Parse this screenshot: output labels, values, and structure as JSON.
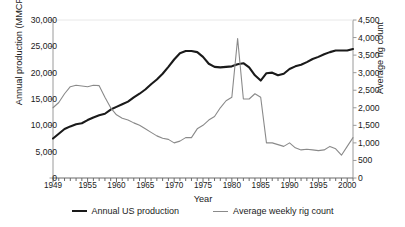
{
  "figure": {
    "cut_off_title": "",
    "background": "#ffffff"
  },
  "axes": {
    "x": {
      "label": "Year",
      "min": 1949,
      "max": 2001,
      "tick_labels": [
        "1949",
        "1955",
        "1960",
        "1965",
        "1970",
        "1975",
        "1980",
        "1985",
        "1990",
        "1995",
        "2000"
      ],
      "tick_values": [
        1949,
        1955,
        1960,
        1965,
        1970,
        1975,
        1980,
        1985,
        1990,
        1995,
        2000
      ],
      "minor_tick_interval": 1
    },
    "y_left": {
      "label": "Annual production (MMCF)",
      "min": 0,
      "max": 30000,
      "tick_labels": [
        "0",
        "5,000",
        "10,000",
        "15,000",
        "20,000",
        "25,000",
        "30,000"
      ],
      "tick_values": [
        0,
        5000,
        10000,
        15000,
        20000,
        25000,
        30000
      ]
    },
    "y_right": {
      "label": "Average rig count",
      "min": 0,
      "max": 4500,
      "tick_labels": [
        "0",
        "500",
        "1,000",
        "1,500",
        "2,000",
        "2,500",
        "3,000",
        "3,500",
        "4,000",
        "4,500"
      ],
      "tick_values": [
        0,
        500,
        1000,
        1500,
        2000,
        2500,
        3000,
        3500,
        4000,
        4500
      ]
    }
  },
  "legend": {
    "position": "bottom-center",
    "entries": [
      {
        "label": "Annual US production",
        "color": "#1a1a1a",
        "width": 2.1,
        "axis": "y_left"
      },
      {
        "label": "Average weekly rig count",
        "color": "#8a8a8a",
        "width": 1.1,
        "axis": "y_right"
      }
    ]
  },
  "chart_data": {
    "type": "line",
    "title": "",
    "xlabel": "Year",
    "ylabel": "Annual production (MMCF)",
    "y2label": "Average rig count",
    "xlim": [
      1949,
      2001
    ],
    "ylim": [
      0,
      30000
    ],
    "y2lim": [
      0,
      4500
    ],
    "grid": false,
    "legend_position": "bottom-center",
    "x": [
      1949,
      1950,
      1951,
      1952,
      1953,
      1954,
      1955,
      1956,
      1957,
      1958,
      1959,
      1960,
      1961,
      1962,
      1963,
      1964,
      1965,
      1966,
      1967,
      1968,
      1969,
      1970,
      1971,
      1972,
      1973,
      1974,
      1975,
      1976,
      1977,
      1978,
      1979,
      1980,
      1981,
      1982,
      1983,
      1984,
      1985,
      1986,
      1987,
      1988,
      1989,
      1990,
      1991,
      1992,
      1993,
      1994,
      1995,
      1996,
      1997,
      1998,
      1999,
      2000,
      2001
    ],
    "series": [
      {
        "name": "Annual US production",
        "color": "#1a1a1a",
        "axis": "y_left",
        "units": "MMCF",
        "values": [
          7500,
          8400,
          9300,
          9800,
          10200,
          10400,
          11000,
          11500,
          11900,
          12200,
          13000,
          13500,
          14000,
          14500,
          15300,
          16000,
          16800,
          17800,
          18700,
          19800,
          21100,
          22500,
          23700,
          24100,
          24100,
          23900,
          23000,
          21700,
          21100,
          21000,
          21100,
          21200,
          21600,
          21800,
          21000,
          19500,
          18500,
          19900,
          20000,
          19500,
          19800,
          20700,
          21200,
          21500,
          22000,
          22600,
          23000,
          23500,
          23900,
          24200,
          24200,
          24200,
          24500
        ]
      },
      {
        "name": "Average weekly rig count",
        "color": "#8a8a8a",
        "axis": "y_right",
        "units": "rigs",
        "values": [
          2000,
          2150,
          2400,
          2600,
          2640,
          2620,
          2600,
          2640,
          2630,
          2300,
          2000,
          1800,
          1700,
          1650,
          1570,
          1500,
          1400,
          1300,
          1200,
          1130,
          1100,
          1000,
          1050,
          1150,
          1150,
          1400,
          1500,
          1650,
          1750,
          2000,
          2200,
          2300,
          3975,
          2250,
          2250,
          2400,
          2300,
          1000,
          1000,
          950,
          900,
          1000,
          860,
          800,
          820,
          800,
          780,
          800,
          900,
          830,
          650,
          900,
          1150
        ]
      }
    ]
  }
}
